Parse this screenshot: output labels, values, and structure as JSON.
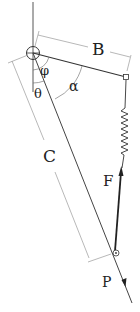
{
  "diagram": {
    "type": "mechanism",
    "labels": {
      "B": "B",
      "C": "C",
      "phi": "φ",
      "theta": "θ",
      "alpha": "α",
      "F": "F",
      "P": "P"
    },
    "colors": {
      "line": "#333333",
      "dim_line": "#888888",
      "background": "#ffffff"
    }
  }
}
